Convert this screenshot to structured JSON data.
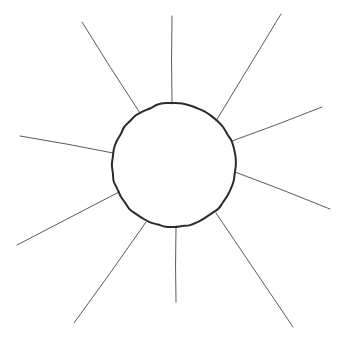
{
  "canvas": {
    "width": 351,
    "height": 343,
    "background_color": "#ffffff",
    "title": "Sun Sketch"
  },
  "drawing": {
    "name": "sun-with-rays",
    "style": "hand-drawn line sketch",
    "stroke_color_circle": "#2b2b2b",
    "stroke_color_rays": "#5a5a5a",
    "circle_stroke_width": 2,
    "ray_stroke_width": 1,
    "fill": "none"
  },
  "circle": {
    "label": "sun-body",
    "cx": 174,
    "cy": 165,
    "r": 62
  },
  "rays": [
    {
      "name": "ray-top",
      "direction": "up",
      "angle_deg": 268,
      "inner": {
        "x": 172,
        "y": 104
      },
      "outer": {
        "x": 172,
        "y": 16
      }
    },
    {
      "name": "ray-upper-right",
      "direction": "up-right",
      "angle_deg": 315,
      "inner": {
        "x": 216,
        "y": 121
      },
      "outer": {
        "x": 281,
        "y": 14
      }
    },
    {
      "name": "ray-right-upper",
      "direction": "right-up",
      "angle_deg": 341,
      "inner": {
        "x": 232,
        "y": 141
      },
      "outer": {
        "x": 322,
        "y": 107
      }
    },
    {
      "name": "ray-right-lower",
      "direction": "right-down",
      "angle_deg": 21,
      "inner": {
        "x": 235,
        "y": 172
      },
      "outer": {
        "x": 330,
        "y": 209
      }
    },
    {
      "name": "ray-lower-right",
      "direction": "down-right",
      "angle_deg": 55,
      "inner": {
        "x": 216,
        "y": 213
      },
      "outer": {
        "x": 293,
        "y": 327
      }
    },
    {
      "name": "ray-bottom",
      "direction": "down",
      "angle_deg": 89,
      "inner": {
        "x": 176,
        "y": 228
      },
      "outer": {
        "x": 176,
        "y": 302
      }
    },
    {
      "name": "ray-lower-left",
      "direction": "down-left",
      "angle_deg": 124,
      "inner": {
        "x": 146,
        "y": 222
      },
      "outer": {
        "x": 74,
        "y": 323
      }
    },
    {
      "name": "ray-left-lower",
      "direction": "left-down",
      "angle_deg": 160,
      "inner": {
        "x": 119,
        "y": 192
      },
      "outer": {
        "x": 17,
        "y": 245
      }
    },
    {
      "name": "ray-left-upper",
      "direction": "left-up",
      "angle_deg": 190,
      "inner": {
        "x": 113,
        "y": 153
      },
      "outer": {
        "x": 20,
        "y": 136
      }
    },
    {
      "name": "ray-upper-left",
      "direction": "up-left",
      "angle_deg": 237,
      "inner": {
        "x": 140,
        "y": 113
      },
      "outer": {
        "x": 82,
        "y": 22
      }
    }
  ]
}
